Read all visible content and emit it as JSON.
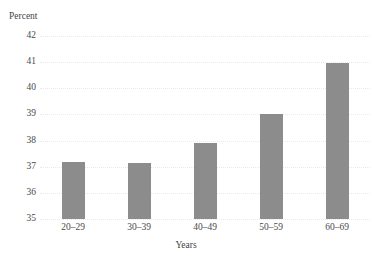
{
  "chart_data": {
    "type": "bar",
    "title": "",
    "xlabel": "Years",
    "ylabel": "Percent",
    "categories": [
      "20–29",
      "30–39",
      "40–49",
      "50–59",
      "60–69"
    ],
    "values": [
      37.2,
      37.15,
      37.9,
      39.0,
      40.95
    ],
    "ylim": [
      35,
      42
    ],
    "ytick_labels": [
      "42",
      "41",
      "40",
      "39",
      "38",
      "37",
      "36",
      "35"
    ],
    "ytick_values": [
      42,
      41,
      40,
      39,
      38,
      37,
      36,
      35
    ],
    "grid": true,
    "legend": false,
    "bar_color": "#8c8c8c",
    "grid_color": "#e6e6e6",
    "text_color": "#4a4a4a",
    "background": "#ffffff"
  },
  "axes": {
    "y_caption": "Percent",
    "x_caption": "Years"
  }
}
